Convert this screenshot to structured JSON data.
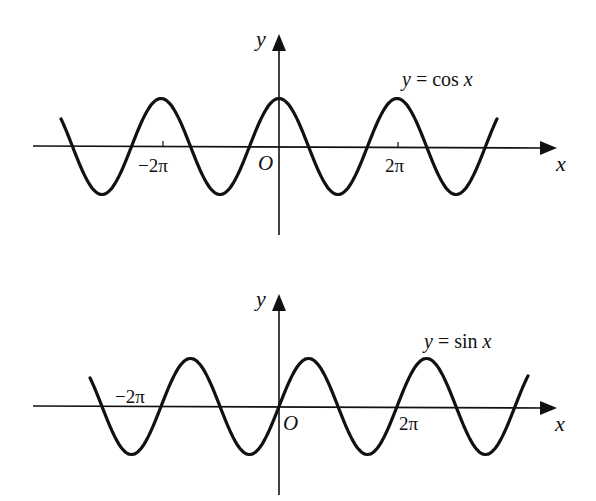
{
  "figures": [
    {
      "id": "cos",
      "equation": {
        "lhs": "y",
        "eq": " = ",
        "fn": "cos ",
        "var": "x"
      },
      "x_axis_label": "x",
      "y_axis_label": "y",
      "origin_label": "O",
      "tick_labels": {
        "neg": "−2π",
        "pos": "2π"
      }
    },
    {
      "id": "sin",
      "equation": {
        "lhs": "y",
        "eq": " = ",
        "fn": "sin ",
        "var": "x"
      },
      "x_axis_label": "x",
      "y_axis_label": "y",
      "origin_label": "O",
      "tick_labels": {
        "neg": "−2π",
        "pos": "2π"
      }
    }
  ],
  "colors": {
    "ink": "#111111",
    "background": "#ffffff"
  },
  "chart_data": [
    {
      "type": "line",
      "title": "y = cos x",
      "xlabel": "x",
      "ylabel": "y",
      "x_ticks": [
        "−2π",
        "O",
        "2π"
      ],
      "x_range": [
        "−4.7π",
        "4.6π"
      ],
      "ylim": [
        -1,
        1
      ],
      "grid": false,
      "series": [
        {
          "name": "cos x",
          "function": "cos(x)",
          "x_range_plotted": [
            "-3.7π",
            "3.7π"
          ],
          "maxima_x": [
            "-2π",
            "0",
            "2π"
          ],
          "minima_x": [
            "-3π",
            "-π",
            "π",
            "3π"
          ]
        }
      ]
    },
    {
      "type": "line",
      "title": "y = sin x",
      "xlabel": "x",
      "ylabel": "y",
      "x_ticks": [
        "−2π",
        "O",
        "2π"
      ],
      "x_range": [
        "−4.7π",
        "4.6π"
      ],
      "ylim": [
        -1,
        1
      ],
      "grid": false,
      "series": [
        {
          "name": "sin x",
          "function": "sin(x)",
          "x_range_plotted": [
            "-3.2π",
            "4.2π"
          ],
          "maxima_x": [
            "-3π/2",
            "π/2",
            "5π/2"
          ],
          "minima_x": [
            "-5π/2",
            "-π/2",
            "3π/2",
            "7π/2"
          ]
        }
      ]
    }
  ]
}
